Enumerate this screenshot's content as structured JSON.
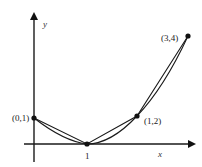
{
  "diagram": {
    "axes": {
      "x_label": "x",
      "y_label": "y"
    },
    "tick_labels": {
      "x_tick_1": "1"
    },
    "points": [
      {
        "label": "(0,1)",
        "x": 0,
        "y": 1
      },
      {
        "label": "(1,0)",
        "x": 1,
        "y": 0
      },
      {
        "label": "(1,2)",
        "x": 2,
        "y": 2
      },
      {
        "label": "(3,4)",
        "x": 3,
        "y": 4
      }
    ],
    "point_labels": {
      "p01": "(0,1)",
      "p12": "(1,2)",
      "p34": "(3,4)"
    },
    "curves": [
      "smooth curve through points",
      "polygonal chord path through points"
    ],
    "colors": {
      "stroke": "#1a1a1a",
      "background": "#ffffff"
    }
  }
}
